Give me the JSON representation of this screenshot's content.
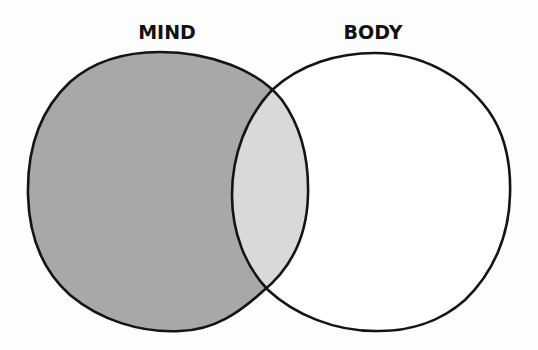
{
  "diagram": {
    "type": "venn",
    "sets": [
      {
        "id": "mind",
        "label": "MIND",
        "fill": "#a8a8a8",
        "label_x": 167
      },
      {
        "id": "body",
        "label": "BODY",
        "fill": "#ffffff",
        "label_x": 373
      }
    ],
    "intersection": {
      "sets": [
        "MIND",
        "BODY"
      ],
      "fill": "#d9d9d9"
    },
    "stroke_color": "#141414"
  }
}
